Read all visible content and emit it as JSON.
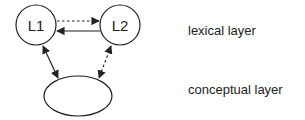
{
  "nodes": {
    "l1": {
      "label": "L1"
    },
    "l2": {
      "label": "L2"
    },
    "concept": {
      "label": ""
    }
  },
  "layers": {
    "lexical": "lexical layer",
    "conceptual": "conceptual layer"
  },
  "edges": [
    {
      "from": "L1",
      "to": "L2",
      "style": "dotted",
      "direction": "forward"
    },
    {
      "from": "L2",
      "to": "L1",
      "style": "solid",
      "direction": "forward"
    },
    {
      "from": "L1",
      "to": "concept",
      "style": "solid",
      "direction": "both"
    },
    {
      "from": "L2",
      "to": "concept",
      "style": "dotted",
      "direction": "both"
    }
  ],
  "colors": {
    "stroke": "#222222",
    "background": "#ffffff"
  }
}
